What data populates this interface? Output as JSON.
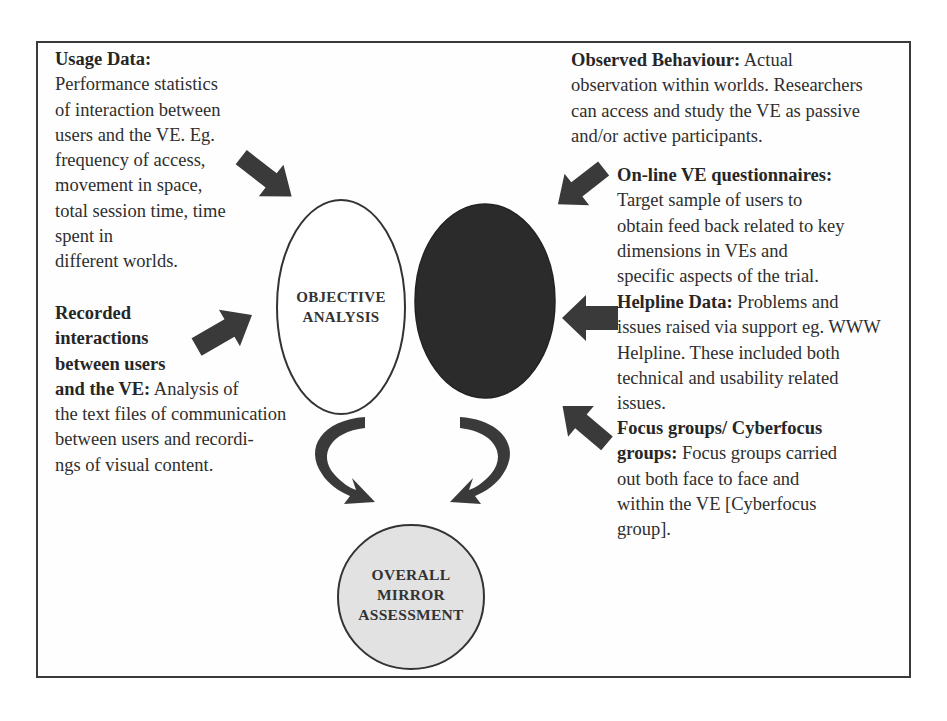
{
  "left_blocks": [
    {
      "heading": "Usage Data:",
      "lines": [
        "Performance statistics",
        "of interaction between",
        "users and the VE. Eg.",
        "frequency  of access,",
        "movement in space,",
        "total session  time, time",
        "spent in",
        "different  worlds."
      ]
    },
    {
      "heading_lines": [
        "Recorded",
        "interactions",
        "between users"
      ],
      "heading_last": "and the VE:",
      "heading_tail": " Analysis of",
      "lines": [
        "the text files of communication",
        "between  users and recordi-",
        "ngs of visual content."
      ]
    }
  ],
  "right_blocks": [
    {
      "heading": "Observed Behaviour:",
      "first_line_tail": " Actual",
      "lines": [
        "observation within worlds. Researchers",
        "can access and study the VE as passive",
        "and/or active participants."
      ]
    },
    {
      "heading": "On-line VE questionnaires:",
      "lines": [
        "Target sample of users to",
        "obtain feed back related to key",
        "dimensions in  VEs and",
        "specific aspects of the trial."
      ]
    },
    {
      "heading": "Helpline Data:",
      "first_line_tail": " Problems and",
      "lines": [
        "issues raised via support eg. WWW",
        "Helpline. These included both",
        "technical and usability related",
        "issues."
      ]
    },
    {
      "heading_lines": [
        "Focus groups/ Cyberfocus"
      ],
      "heading_last": "groups:",
      "heading_tail": " Focus groups carried",
      "lines": [
        "out both face to face and",
        "within the VE [Cyberfocus",
        "group]."
      ]
    }
  ],
  "nodes": {
    "objective": {
      "lines": [
        "OBJECTIVE",
        "ANALYSIS"
      ],
      "fill": "#ffffff"
    },
    "subjective": {
      "lines": [],
      "fill": "#2b2b2b"
    },
    "overall": {
      "lines": [
        "OVERALL",
        "MIRROR",
        "ASSESSMENT"
      ],
      "fill": "#e2e2e2"
    }
  },
  "colors": {
    "arrow": "#3a3a3a",
    "border": "#3a3a3a",
    "text": "#2e2e2e"
  }
}
